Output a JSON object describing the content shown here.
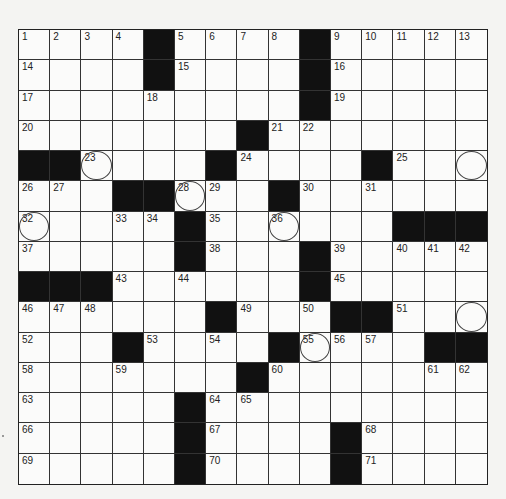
{
  "puzzle": {
    "rows": 15,
    "cols": 15,
    "grid": [
      [
        "1",
        "2",
        "3",
        "4",
        "#",
        "5",
        "6",
        "7",
        "8",
        "#",
        "9",
        "10",
        "11",
        "12",
        "13"
      ],
      [
        "14",
        "",
        "",
        "",
        "#",
        "15",
        "",
        "",
        "",
        "#",
        "16",
        "",
        "",
        "",
        ""
      ],
      [
        "17",
        "",
        "",
        "",
        "18",
        "",
        "",
        "",
        "",
        "#",
        "19",
        "",
        "",
        "",
        ""
      ],
      [
        "20",
        "",
        "",
        "",
        "",
        "",
        "",
        "#",
        "21",
        "22",
        "",
        "",
        "",
        "",
        ""
      ],
      [
        "#",
        "#",
        "23",
        "",
        "",
        "",
        "#",
        "24",
        "",
        "",
        "",
        "#",
        "25",
        "",
        ""
      ],
      [
        "26",
        "27",
        "",
        "#",
        "#",
        "28",
        "29",
        "",
        "#",
        "30",
        "",
        "31",
        "",
        "",
        ""
      ],
      [
        "32",
        "",
        "",
        "33",
        "34",
        "#",
        "35",
        "",
        "36",
        "",
        "",
        "",
        "#",
        "#",
        "#"
      ],
      [
        "37",
        "",
        "",
        "",
        "",
        "#",
        "38",
        "",
        "",
        "#",
        "39",
        "",
        "40",
        "41",
        "42"
      ],
      [
        "#",
        "#",
        "#",
        "43",
        "",
        "44",
        "",
        "",
        "",
        "#",
        "45",
        "",
        "",
        "",
        ""
      ],
      [
        "46",
        "47",
        "48",
        "",
        "",
        "",
        "#",
        "49",
        "",
        "50",
        "#",
        "#",
        "51",
        "",
        ""
      ],
      [
        "52",
        "",
        "",
        "#",
        "53",
        "",
        "54",
        "",
        "#",
        "55",
        "56",
        "57",
        "",
        "#",
        "#"
      ],
      [
        "58",
        "",
        "",
        "59",
        "",
        "",
        "",
        "#",
        "60",
        "",
        "",
        "",
        "",
        "61",
        "62"
      ],
      [
        "63",
        "",
        "",
        "",
        "",
        "#",
        "64",
        "65",
        "",
        "",
        "",
        "",
        "",
        "",
        ""
      ],
      [
        "66",
        "",
        "",
        "",
        "",
        "#",
        "67",
        "",
        "",
        "",
        "#",
        "68",
        "",
        "",
        ""
      ],
      [
        "69",
        "",
        "",
        "",
        "",
        "#",
        "70",
        "",
        "",
        "",
        "#",
        "71",
        "",
        "",
        ""
      ]
    ],
    "circled": [
      [
        4,
        2
      ],
      [
        4,
        14
      ],
      [
        5,
        5
      ],
      [
        6,
        0
      ],
      [
        6,
        8
      ],
      [
        9,
        14
      ],
      [
        10,
        9
      ]
    ],
    "colors": {
      "black": "#111111",
      "line": "#333333",
      "paper": "#fbfbfa"
    }
  }
}
